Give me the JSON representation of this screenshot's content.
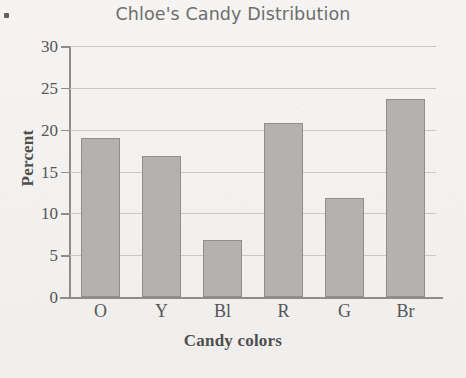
{
  "chart_data": {
    "type": "bar",
    "title": "Chloe's Candy Distribution",
    "xlabel": "Candy colors",
    "ylabel": "Percent",
    "categories": [
      "O",
      "Y",
      "Bl",
      "R",
      "G",
      "Br"
    ],
    "values": [
      19.0,
      16.9,
      6.8,
      20.8,
      11.8,
      23.7
    ],
    "ylim": [
      0,
      30
    ],
    "yticks": [
      0,
      5,
      10,
      15,
      20,
      25,
      30
    ],
    "ytick_labels": [
      "0",
      "5",
      "10",
      "15",
      "20",
      "25",
      "30"
    ],
    "grid": true,
    "grid_axis": "y",
    "legend": false,
    "bar_color": "#b3b2b0",
    "bar_edge_color": "#8f8e8c",
    "grid_color": "#c9c8c6",
    "axis_color": "#8e8d8b",
    "title_color": "#6d6d6d",
    "background_color": "#f2f1ef"
  }
}
